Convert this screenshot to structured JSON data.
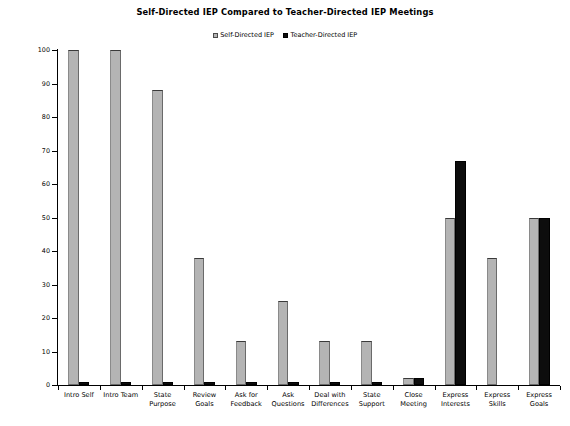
{
  "chart_data": {
    "type": "bar",
    "title": "Self-Directed IEP Compared to Teacher-Directed IEP Meetings",
    "xlabel": "",
    "ylabel": "Percent of IEP Meeting Leadership Steps",
    "ylim": [
      0,
      100
    ],
    "ytick_step": 10,
    "yticks": [
      0,
      10,
      20,
      30,
      40,
      50,
      60,
      70,
      80,
      90,
      100
    ],
    "ytick_labels": [
      "0",
      "10",
      "20",
      "30",
      "40",
      "50",
      "60",
      "70",
      "80",
      "90",
      "100"
    ],
    "grid": false,
    "legend_position": "top-center",
    "categories": [
      "Intro Self",
      "Intro Team",
      "State Purpose",
      "Review Goals",
      "Ask for Feedback",
      "Ask Questions",
      "Deal with Differences",
      "State Support",
      "Close Meeting",
      "Express Interests",
      "Express Skills",
      "Express Goals"
    ],
    "category_label_lines": [
      [
        "Intro Self"
      ],
      [
        "Intro Team"
      ],
      [
        "State",
        "Purpose"
      ],
      [
        "Review",
        "Goals"
      ],
      [
        "Ask for",
        "Feedback"
      ],
      [
        "Ask",
        "Questions"
      ],
      [
        "Deal with",
        "Differences"
      ],
      [
        "State",
        "Support"
      ],
      [
        "Close",
        "Meeting"
      ],
      [
        "Express",
        "Interests"
      ],
      [
        "Express",
        "Skills"
      ],
      [
        "Express",
        "Goals"
      ]
    ],
    "series": [
      {
        "name": "Self-Directed IEP",
        "color": "#b4b4b4",
        "values": [
          100,
          100,
          88,
          38,
          13,
          25,
          13,
          13,
          2,
          50,
          38,
          50
        ]
      },
      {
        "name": "Teacher-Directed IEP",
        "color": "#0d0d0d",
        "values": [
          1,
          1,
          1,
          1,
          1,
          1,
          1,
          1,
          2,
          67,
          0,
          50
        ]
      }
    ]
  },
  "legend": {
    "entries": [
      {
        "label": "Self-Directed IEP",
        "swatch": "series-self"
      },
      {
        "label": "Teacher-Directed IEP",
        "swatch": "series-teacher"
      }
    ]
  }
}
